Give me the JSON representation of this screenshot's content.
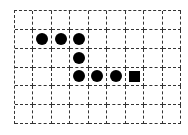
{
  "board": {
    "columns": 9,
    "rows": 6,
    "grid_line_color": "#333333",
    "grid_line_style": "dashed",
    "background": "#ffffff",
    "pieces": [
      {
        "row": 1,
        "col": 1,
        "shape": "circle",
        "color": "#000000"
      },
      {
        "row": 1,
        "col": 2,
        "shape": "circle",
        "color": "#000000"
      },
      {
        "row": 1,
        "col": 3,
        "shape": "circle",
        "color": "#000000"
      },
      {
        "row": 2,
        "col": 3,
        "shape": "circle",
        "color": "#000000"
      },
      {
        "row": 3,
        "col": 3,
        "shape": "circle",
        "color": "#000000"
      },
      {
        "row": 3,
        "col": 4,
        "shape": "circle",
        "color": "#000000"
      },
      {
        "row": 3,
        "col": 5,
        "shape": "circle",
        "color": "#000000"
      },
      {
        "row": 3,
        "col": 6,
        "shape": "square",
        "color": "#000000"
      }
    ]
  }
}
